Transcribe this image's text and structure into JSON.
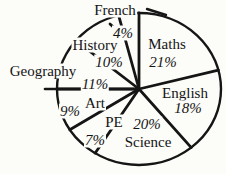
{
  "chart_data": {
    "type": "pie",
    "unit": "%",
    "direction": "clockwise",
    "start_angle_deg": 0,
    "stroke_color": "#151515",
    "background_color": "#fcfcf9",
    "legend_position": "none",
    "labels_placement": "on-slices, French and Geography outside with leader lines",
    "series": [
      {
        "label": "Maths",
        "value": 21,
        "pct_text": "21%"
      },
      {
        "label": "English",
        "value": 18,
        "pct_text": "18%"
      },
      {
        "label": "Science",
        "value": 20,
        "pct_text": "20%"
      },
      {
        "label": "PE",
        "value": 7,
        "pct_text": "7%"
      },
      {
        "label": "Art",
        "value": 9,
        "pct_text": "9%"
      },
      {
        "label": "Geography",
        "value": 11,
        "pct_text": "11%"
      },
      {
        "label": "History",
        "value": 10,
        "pct_text": "10%"
      },
      {
        "label": "French",
        "value": 4,
        "pct_text": "4%"
      }
    ]
  }
}
